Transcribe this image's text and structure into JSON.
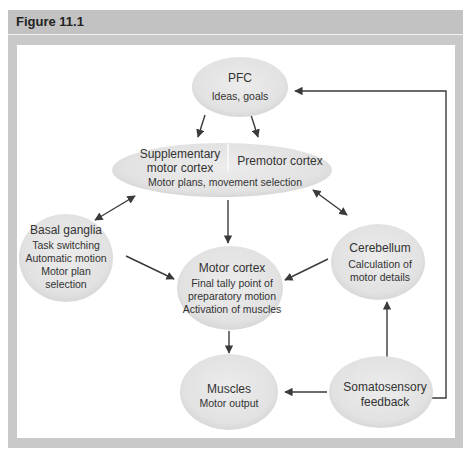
{
  "figure": {
    "title": "Figure 11.1"
  },
  "nodes": {
    "pfc": {
      "title": "PFC",
      "lines": [
        "Ideas, goals"
      ]
    },
    "sma": {
      "title_left": [
        "Supplementary",
        "motor cortex"
      ],
      "title_right": "Premotor cortex",
      "sub": "Motor plans, movement selection"
    },
    "basal_ganglia": {
      "title": "Basal ganglia",
      "lines": [
        "Task switching",
        "Automatic motion",
        "Motor plan",
        "selection"
      ]
    },
    "cerebellum": {
      "title": "Cerebellum",
      "lines": [
        "Calculation of",
        "motor details"
      ]
    },
    "motor_cortex": {
      "title": "Motor cortex",
      "lines": [
        "Final tally point of",
        "preparatory motion",
        "Activation of muscles"
      ]
    },
    "muscles": {
      "title": "Muscles",
      "lines": [
        "Motor output"
      ]
    },
    "somatosensory": {
      "title": "Somatosensory",
      "lines": [
        "feedback"
      ]
    }
  },
  "edges": [
    {
      "from": "PFC",
      "to": "Supplementary motor cortex"
    },
    {
      "from": "PFC",
      "to": "Premotor cortex"
    },
    {
      "from": "Supplementary/Premotor",
      "to": "Basal ganglia",
      "bidirectional": true
    },
    {
      "from": "Supplementary/Premotor",
      "to": "Cerebellum",
      "bidirectional": true
    },
    {
      "from": "Supplementary/Premotor",
      "to": "Motor cortex"
    },
    {
      "from": "Basal ganglia",
      "to": "Motor cortex"
    },
    {
      "from": "Cerebellum",
      "to": "Motor cortex"
    },
    {
      "from": "Motor cortex",
      "to": "Muscles"
    },
    {
      "from": "Somatosensory feedback",
      "to": "Muscles"
    },
    {
      "from": "Somatosensory feedback",
      "to": "Cerebellum"
    },
    {
      "from": "Somatosensory feedback",
      "to": "PFC"
    }
  ],
  "colors": {
    "frame": "#c9c9c9",
    "node_fill": "#e4e4e4",
    "arrow": "#3a3a3a"
  }
}
